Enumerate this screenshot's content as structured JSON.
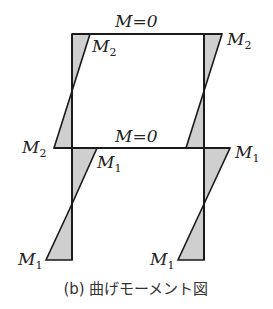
{
  "diagram": {
    "labels": {
      "top_beam": "M=0",
      "mid_beam": "M=0",
      "top_left": {
        "base": "M",
        "sub": "2"
      },
      "top_right": {
        "base": "M",
        "sub": "2"
      },
      "mid_left": {
        "base": "M",
        "sub": "2"
      },
      "mid_left_inner": {
        "base": "M",
        "sub": "1"
      },
      "mid_right": {
        "base": "M",
        "sub": "1"
      },
      "bottom_left": {
        "base": "M",
        "sub": "1"
      },
      "bottom_right": {
        "base": "M",
        "sub": "1"
      }
    },
    "caption": "(b) 曲げモーメント図",
    "colors": {
      "stroke": "#1a1a1a",
      "fill": "#cfcfcf"
    }
  }
}
